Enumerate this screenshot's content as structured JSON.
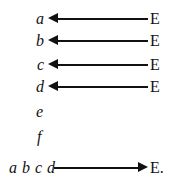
{
  "figure": {
    "background_color": "#ffffff",
    "ink_color": "#111111",
    "rows": [
      {
        "id": "row-a",
        "left_label": "a",
        "right_label": "E",
        "arrow_direction": "left",
        "top": 8,
        "left_label_x": 36,
        "right_label_x": 150,
        "shaft_left": 58,
        "shaft_width": 90,
        "head_x": 48
      },
      {
        "id": "row-b",
        "left_label": "b",
        "right_label": "E",
        "arrow_direction": "left",
        "top": 30,
        "left_label_x": 36,
        "right_label_x": 150,
        "shaft_left": 58,
        "shaft_width": 90,
        "head_x": 48
      },
      {
        "id": "row-c",
        "left_label": "c",
        "right_label": "E",
        "arrow_direction": "left",
        "top": 54,
        "left_label_x": 37,
        "right_label_x": 150,
        "shaft_left": 58,
        "shaft_width": 90,
        "head_x": 48
      },
      {
        "id": "row-d",
        "left_label": "d",
        "right_label": "E",
        "arrow_direction": "left",
        "top": 76,
        "left_label_x": 36,
        "right_label_x": 150,
        "shaft_left": 58,
        "shaft_width": 90,
        "head_x": 48
      }
    ],
    "bare_terms": [
      {
        "id": "term-e",
        "label": "e",
        "x": 36,
        "y": 101
      },
      {
        "id": "term-f",
        "label": "f",
        "x": 37,
        "y": 126
      }
    ],
    "bottom_row": {
      "id": "row-abcd",
      "left_label": "a b c d",
      "right_label": "E.",
      "arrow_direction": "right",
      "top": 157,
      "left_label_x": 9,
      "right_label_x": 150,
      "shaft_left": 54,
      "shaft_width": 86,
      "head_x": 138
    }
  }
}
